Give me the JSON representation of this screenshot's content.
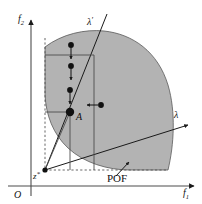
{
  "figure": {
    "background_color": "#ffffff",
    "stroke_color": "#1a1a1a",
    "region_fill": "#b3b3b3",
    "region_stroke": "#4d4d4d",
    "dashed_color": "#555555"
  },
  "axes": {
    "x_axis": {
      "name": "f1-axis",
      "label": "f",
      "subscript": "1",
      "label_x": 186,
      "label_y": 192,
      "start_x": 8,
      "start_y": 186,
      "end_x": 196,
      "end_y": 186
    },
    "y_axis": {
      "name": "f2-axis",
      "label": "f",
      "subscript": "2",
      "label_x": 21,
      "label_y": 19,
      "start_x": 31,
      "start_y": 196,
      "end_x": 31,
      "end_y": 18
    },
    "origin": {
      "label": "O",
      "label_x": 17,
      "label_y": 197,
      "x": 31,
      "y": 186
    }
  },
  "labels": [
    {
      "name": "lambda-prime-label",
      "text": "λ",
      "prime": "′",
      "x": 91,
      "y": 24,
      "italic": true
    },
    {
      "name": "lambda-label",
      "text": "λ",
      "prime": "",
      "x": 177,
      "y": 116,
      "italic": true
    },
    {
      "name": "point-a-label",
      "text": "A",
      "prime": "",
      "x": 77,
      "y": 119,
      "italic": true
    },
    {
      "name": "pof-label",
      "text": "POF",
      "prime": "",
      "x": 110,
      "y": 180,
      "italic": false
    },
    {
      "name": "reference-point-label",
      "text": "z",
      "prime": "*",
      "x": 35,
      "y": 177,
      "italic": true
    }
  ],
  "points": {
    "point_a": {
      "name": "point-A",
      "x": 70,
      "y": 112,
      "radius": 4.2
    },
    "reference_point": {
      "name": "reference-point-z-star",
      "x": 45,
      "y": 170,
      "radius": 2.6
    },
    "moving_points_vertical": [
      {
        "name": "moving-point-1",
        "x": 71,
        "y": 45,
        "radius": 2.9
      },
      {
        "name": "moving-point-2",
        "x": 71,
        "y": 66,
        "radius": 2.9
      },
      {
        "name": "moving-point-3",
        "x": 70,
        "y": 90,
        "radius": 2.9
      }
    ],
    "moving_point_horizontal": {
      "name": "moving-point-horizontal",
      "x": 101,
      "y": 105,
      "radius": 2.9
    }
  },
  "arrows": {
    "vertical_down": [
      {
        "name": "down-arrow-1",
        "x": 71,
        "y1": 48,
        "y2": 58
      },
      {
        "name": "down-arrow-2",
        "x": 71,
        "y1": 69,
        "y2": 79
      },
      {
        "name": "down-arrow-3",
        "x": 70,
        "y1": 93,
        "y2": 103
      }
    ],
    "horizontal_left": {
      "name": "left-arrow",
      "y": 105,
      "x1": 98,
      "x2": 88
    },
    "pof_pointer": {
      "name": "pof-pointer-arrow",
      "x1": 117,
      "y1": 175,
      "x2": 128,
      "y2": 163
    }
  },
  "region": {
    "name": "feasible-objective-region",
    "description": "shaded quarter-disc feasible region bounded by the Pareto optimal front"
  },
  "lines": {
    "lambda_ray": {
      "name": "lambda-ray",
      "x1": 45,
      "y1": 170,
      "x2": 190,
      "y2": 124
    },
    "lambda_prime_ray": {
      "name": "lambda-prime-ray",
      "x1": 45,
      "y1": 170,
      "x2": 108,
      "y2": 15
    },
    "to_point_a": {
      "name": "ray-to-point-A",
      "x1": 45,
      "y1": 170,
      "x2": 70,
      "y2": 112
    },
    "horizontal_guide": {
      "name": "horizontal-guide-at-A",
      "x1": 45,
      "y1": 112,
      "x2": 70,
      "y2": 112
    },
    "upper_horizontal_guide": {
      "name": "upper-horizontal-guide",
      "x1": 45,
      "y1": 55,
      "x2": 94,
      "y2": 55
    },
    "vertical_guide_a": {
      "name": "vertical-guide-at-A",
      "x": 70,
      "y1": 112,
      "y2": 170
    },
    "vertical_guide_right": {
      "name": "vertical-guide-right",
      "x": 94,
      "y1": 55,
      "y2": 170
    },
    "dashed_vertical": {
      "name": "dashed-vertical-from-z-star",
      "x": 45,
      "y1": 38,
      "y2": 170
    },
    "dashed_horizontal": {
      "name": "dashed-horizontal-from-z-star",
      "y": 170,
      "x1": 45,
      "x2": 168
    }
  }
}
